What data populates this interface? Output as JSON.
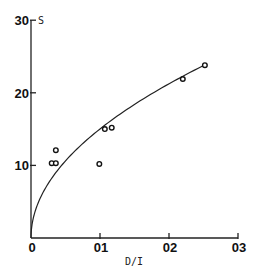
{
  "chart_data": {
    "type": "scatter",
    "title": "",
    "xlabel": "D/I",
    "ylabel": "S",
    "xlim": [
      0,
      0.3
    ],
    "ylim": [
      0,
      30
    ],
    "x_ticks": [
      "0",
      "01",
      "02",
      "03"
    ],
    "y_ticks": [
      "0",
      "10",
      "20",
      "30"
    ],
    "grid": false,
    "legend": null,
    "series": [
      {
        "name": "observed",
        "marker": "open-circle",
        "points": [
          {
            "x": 0.03,
            "y": 10.3
          },
          {
            "x": 0.036,
            "y": 10.3
          },
          {
            "x": 0.036,
            "y": 12.1
          },
          {
            "x": 0.099,
            "y": 10.2
          },
          {
            "x": 0.107,
            "y": 15.0
          },
          {
            "x": 0.117,
            "y": 15.2
          },
          {
            "x": 0.22,
            "y": 21.9
          },
          {
            "x": 0.252,
            "y": 23.8
          }
        ]
      },
      {
        "name": "fitted curve",
        "type": "line",
        "formula": "S = 47.5 * sqrt(D/I)",
        "x_range": [
          0,
          0.255
        ]
      }
    ]
  }
}
